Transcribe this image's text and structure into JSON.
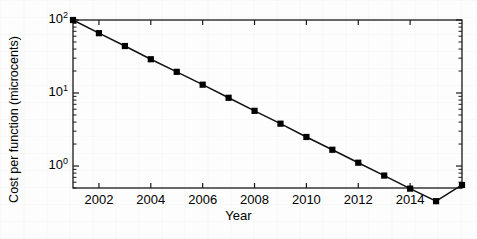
{
  "chart_data": {
    "type": "line",
    "title": "",
    "subtitle": "",
    "xlabel": "Year",
    "ylabel": "Cost per function (microcents)",
    "yscale": "log",
    "xscale": "linear",
    "xlim": [
      2001,
      2016
    ],
    "ylim": [
      0.5,
      100
    ],
    "grid": false,
    "legend": null,
    "marker": "square",
    "marker_color": "#000000",
    "line_color": "#000000",
    "x": [
      2001,
      2002,
      2003,
      2004,
      2005,
      2006,
      2007,
      2008,
      2009,
      2010,
      2011,
      2012,
      2013,
      2014,
      2015,
      2016
    ],
    "values": [
      100,
      66,
      44,
      29,
      19.5,
      13,
      8.6,
      5.7,
      3.8,
      2.5,
      1.67,
      1.11,
      0.74,
      0.49,
      0.33,
      0.55
    ],
    "series": [
      {
        "name": "Cost per function",
        "values": [
          100,
          66,
          44,
          29,
          19.5,
          13,
          8.6,
          5.7,
          3.8,
          2.5,
          1.67,
          1.11,
          0.74,
          0.49,
          0.33,
          0.55
        ]
      }
    ],
    "xticks": [
      2002,
      2004,
      2006,
      2008,
      2010,
      2012,
      2014
    ],
    "xtick_labels": [
      "2002",
      "2004",
      "2006",
      "2008",
      "2010",
      "2012",
      "2014"
    ],
    "yticks": [
      1,
      10,
      100
    ],
    "ytick_labels": [
      "10⁰",
      "10¹",
      "10²"
    ],
    "ytick_mantissa": [
      "10",
      "10",
      "10"
    ],
    "ytick_exponent": [
      "0",
      "1",
      "2"
    ],
    "annotations": []
  },
  "axes": {
    "x_axis_name": "Year",
    "y_axis_name": "Cost per function (microcents)"
  }
}
